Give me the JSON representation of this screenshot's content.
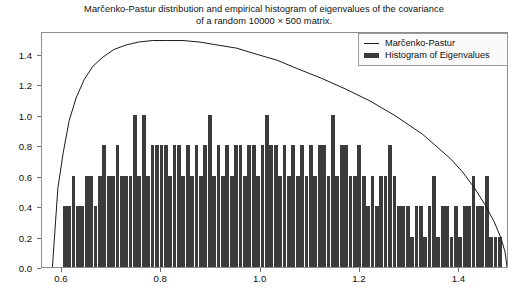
{
  "chart": {
    "title_line1": "Marčenko-Pastur distribution and empirical histogram of eigenvalues of the covariance",
    "title_line2": "of a random 10000 × 500 matrix.",
    "legend": {
      "curve_label": "Marčenko-Pastur",
      "hist_label": "Histogram of Eigenvalues"
    },
    "yticks": [
      "0.0",
      "0.2",
      "0.4",
      "0.6",
      "0.8",
      "1.0",
      "1.2",
      "1.4"
    ],
    "xticks": [
      "0.6",
      "0.8",
      "1.0",
      "1.2",
      "1.4"
    ]
  },
  "chart_data": {
    "type": "bar",
    "title": "Marčenko-Pastur distribution and empirical histogram of eigenvalues of the covariance of a random 10000 × 500 matrix.",
    "xlabel": "",
    "ylabel": "",
    "xlim": [
      0.56,
      1.5
    ],
    "ylim": [
      0.0,
      1.55
    ],
    "xtick_values": [
      0.6,
      0.8,
      1.0,
      1.2,
      1.4
    ],
    "ytick_values": [
      0.0,
      0.2,
      0.4,
      0.6,
      0.8,
      1.0,
      1.2,
      1.4
    ],
    "grid": false,
    "legend_position": "upper right",
    "series": [
      {
        "name": "Histogram of Eigenvalues",
        "type": "bar",
        "color": "#3b3b3b",
        "bin_width": 0.00885,
        "bin_left_edges": [
          0.6018,
          0.6106,
          0.6195,
          0.6283,
          0.6372,
          0.646,
          0.6549,
          0.6637,
          0.6726,
          0.6814,
          0.6903,
          0.6991,
          0.708,
          0.7168,
          0.7257,
          0.7345,
          0.7434,
          0.7522,
          0.7611,
          0.7699,
          0.7788,
          0.7876,
          0.7965,
          0.8053,
          0.8142,
          0.823,
          0.8319,
          0.8407,
          0.8496,
          0.8584,
          0.8673,
          0.8761,
          0.885,
          0.8938,
          0.9027,
          0.9115,
          0.9204,
          0.9292,
          0.9381,
          0.9469,
          0.9558,
          0.9646,
          0.9735,
          0.9823,
          0.9912,
          1.0,
          1.0089,
          1.0177,
          1.0266,
          1.0354,
          1.0443,
          1.0531,
          1.062,
          1.0708,
          1.0797,
          1.0885,
          1.0974,
          1.1062,
          1.1151,
          1.1239,
          1.1328,
          1.1416,
          1.1505,
          1.1593,
          1.1682,
          1.177,
          1.1859,
          1.1947,
          1.2036,
          1.2124,
          1.2213,
          1.2301,
          1.239,
          1.2478,
          1.2567,
          1.2655,
          1.2744,
          1.2832,
          1.2921,
          1.3009,
          1.3098,
          1.3186,
          1.3275,
          1.3363,
          1.3452,
          1.354,
          1.3629,
          1.3717,
          1.3806,
          1.3894,
          1.3983,
          1.4071,
          1.416,
          1.4248,
          1.4337,
          1.4425,
          1.4514,
          1.4602,
          1.4691,
          1.4779
        ],
        "values": [
          0.4,
          0.4,
          0.6,
          0.4,
          0.4,
          0.6,
          0.6,
          0.4,
          0.6,
          0.8,
          0.6,
          0.6,
          0.8,
          0.6,
          0.6,
          0.6,
          1.0,
          0.6,
          1.0,
          0.6,
          0.8,
          0.8,
          0.8,
          0.8,
          0.6,
          0.8,
          0.8,
          0.6,
          0.8,
          0.6,
          0.8,
          0.6,
          0.8,
          1.0,
          0.6,
          0.8,
          0.6,
          0.8,
          0.6,
          0.8,
          0.8,
          0.6,
          0.8,
          0.8,
          0.6,
          0.8,
          1.0,
          0.8,
          0.8,
          0.6,
          0.8,
          0.6,
          0.8,
          0.6,
          0.8,
          0.6,
          0.8,
          0.6,
          0.8,
          0.8,
          0.6,
          1.0,
          0.6,
          0.8,
          0.8,
          0.6,
          0.6,
          0.8,
          0.6,
          0.4,
          0.6,
          0.4,
          0.6,
          0.6,
          0.8,
          0.6,
          0.4,
          0.4,
          0.4,
          0.2,
          0.4,
          0.4,
          0.2,
          0.4,
          0.6,
          0.2,
          0.4,
          0.4,
          0.2,
          0.4,
          0.2,
          0.4,
          0.4,
          0.6,
          0.4,
          0.4,
          0.6,
          0.2,
          0.2,
          0.2
        ]
      },
      {
        "name": "Marčenko-Pastur",
        "type": "line",
        "color": "#1a1a1a",
        "x": [
          0.5811,
          0.592,
          0.603,
          0.615,
          0.629,
          0.645,
          0.663,
          0.683,
          0.705,
          0.729,
          0.755,
          0.783,
          0.813,
          0.845,
          0.879,
          0.915,
          0.953,
          0.993,
          1.035,
          1.079,
          1.125,
          1.173,
          1.223,
          1.275,
          1.329,
          1.385,
          1.41,
          1.435,
          1.456,
          1.474,
          1.488,
          1.496,
          1.5
        ],
        "y": [
          0.0,
          0.52,
          0.76,
          0.97,
          1.12,
          1.24,
          1.33,
          1.39,
          1.44,
          1.47,
          1.49,
          1.5,
          1.5,
          1.5,
          1.49,
          1.47,
          1.45,
          1.41,
          1.37,
          1.31,
          1.25,
          1.18,
          1.1,
          1.0,
          0.88,
          0.72,
          0.63,
          0.52,
          0.41,
          0.3,
          0.19,
          0.1,
          0.0
        ]
      }
    ]
  }
}
